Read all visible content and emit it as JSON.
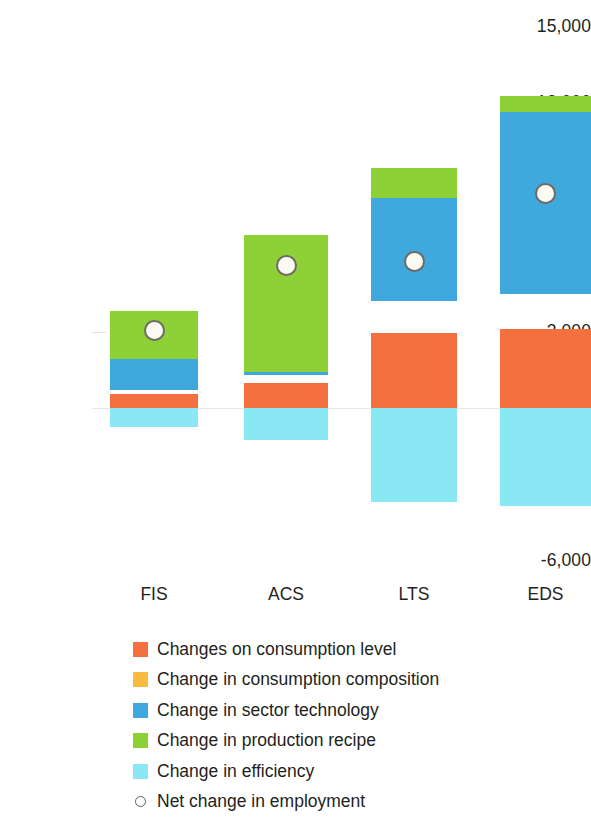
{
  "chart_data": {
    "type": "bar",
    "title": "",
    "subtitle": "",
    "xlabel": "",
    "ylabel": "",
    "stacked": true,
    "grid": false,
    "legend_position": "bottom",
    "categories": [
      "FIS",
      "ACS",
      "LTS",
      "EDS"
    ],
    "ylim": [
      -6000,
      15000
    ],
    "yticks": [
      15000,
      12000,
      9000,
      6000,
      3000,
      0,
      -3000,
      -6000
    ],
    "ytick_labels": [
      "15,000",
      "12,000",
      "9,000",
      "6,000",
      "3,000",
      "0",
      "-3,000",
      "-6,000"
    ],
    "series": [
      {
        "name": "Changes on consumption level",
        "color": "#f4703e",
        "values": [
          550,
          1000,
          2950,
          3100
        ]
      },
      {
        "name": "Change in consumption composition",
        "color": "#f9b game",
        "values": [
          160,
          280,
          1250,
          1400
        ]
      },
      {
        "name": "Change in sector technology",
        "color": "#3fa9dd",
        "values": [
          1220,
          120,
          4050,
          7150
        ]
      },
      {
        "name": "Change in production recipe",
        "color": "#8ed136",
        "values": [
          1890,
          5390,
          1180,
          630
        ]
      },
      {
        "name": "Change in efficiency",
        "color": "#8ae8f4",
        "values": [
          -750,
          -1250,
          -3700,
          -3850
        ]
      }
    ],
    "net_change": {
      "name": "Net change in employment",
      "marker": "open-circle",
      "marker_face": "#fbfbf3",
      "marker_edge": "#6e6a65",
      "values": [
        3050,
        5600,
        5750,
        8450
      ]
    },
    "bar_totals": [
      3820,
      6790,
      9430,
      12280
    ]
  },
  "legend": {
    "items": [
      {
        "label": "Changes on consumption level",
        "color": "#f4703e",
        "marker": "square"
      },
      {
        "label": "Change in consumption composition",
        "color": "#f9bc40",
        "marker": "square"
      },
      {
        "label": "Change in sector technology",
        "color": "#3fa9dd",
        "marker": "square"
      },
      {
        "label": "Change in production recipe",
        "color": "#8ed136",
        "marker": "square"
      },
      {
        "label": "Change in efficiency",
        "color": "#8ae8f4",
        "marker": "square"
      },
      {
        "label": "Net change in employment",
        "color": "#ffffff",
        "marker": "open-circle"
      }
    ]
  },
  "axis": {
    "y_labels": [
      "15,000",
      "12,000",
      "9,000",
      "6,000",
      "3,000",
      "0",
      "-3,000",
      "-6,000"
    ],
    "x_labels": [
      "FIS",
      "ACS",
      "LTS",
      "EDS"
    ]
  },
  "colors": {
    "consumption_level": "#f4703e",
    "consumption_composition": "#f9bc40",
    "sector_technology": "#3fa9dd",
    "production_recipe": "#8ed136",
    "efficiency": "#8ae8f4",
    "net_marker_face": "#fbfbf3",
    "net_marker_edge": "#6e6a65",
    "text": "#231f20",
    "zero_line": "#ece4e5"
  }
}
